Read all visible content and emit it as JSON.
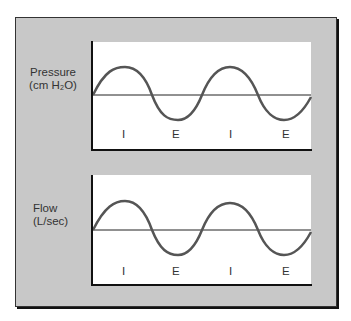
{
  "diagram": {
    "panels": [
      {
        "title_line1": "Pressure",
        "title_line2": "(cm H₂O)",
        "phase_labels": [
          "I",
          "E",
          "I",
          "E"
        ]
      },
      {
        "title_line1": "Flow",
        "title_line2": "(L/sec)",
        "phase_labels": [
          "I",
          "E",
          "I",
          "E"
        ]
      }
    ],
    "colors": {
      "frame_bg": "#c8c8c8",
      "plot_bg": "#ffffff",
      "wave": "#555555",
      "axis": "#111111"
    }
  }
}
